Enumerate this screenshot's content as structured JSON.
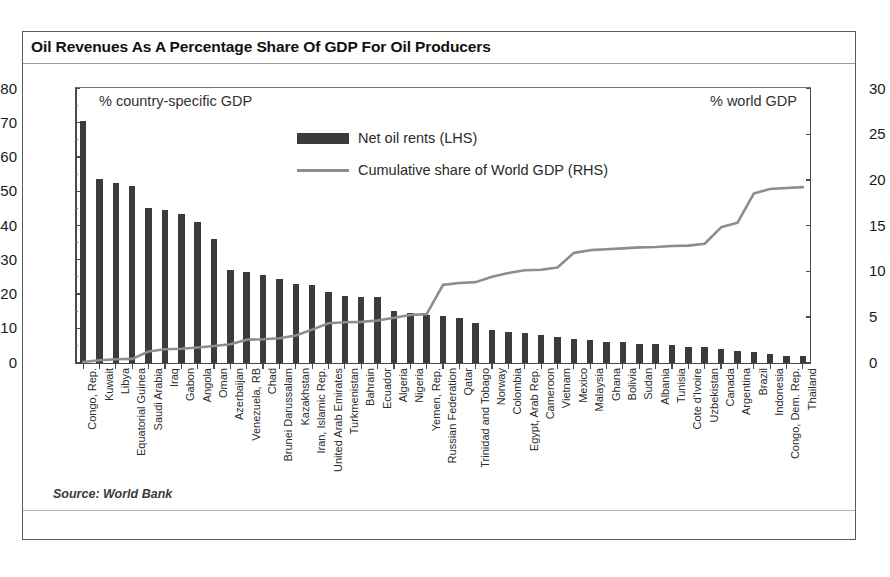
{
  "figure": {
    "title": "Oil Revenues As A Percentage Share Of GDP For Oil Producers",
    "source": "Source: World Bank",
    "left_annotation": "% country-specific GDP",
    "right_annotation": "% world GDP",
    "bar_color": "#3b3b3b",
    "line_color": "#8d8d8d",
    "frame_color": "#5a5a5a"
  },
  "legend": {
    "items": [
      {
        "label": "Net oil rents (LHS)",
        "marker": "bar-swatch"
      },
      {
        "label": "Cumulative share of World GDP (RHS)",
        "marker": "line-swatch"
      }
    ]
  },
  "axes": {
    "left_ticks": [
      "80",
      "70",
      "60",
      "50",
      "40",
      "30",
      "20",
      "10",
      "0"
    ],
    "right_ticks": [
      "30",
      "25",
      "20",
      "15",
      "10",
      "5",
      "0"
    ],
    "left_range": [
      0,
      80
    ],
    "right_range": [
      0,
      30
    ]
  },
  "chart_data": {
    "type": "bar",
    "title": "Oil Revenues As A Percentage Share Of GDP For Oil Producers",
    "subtitle": "",
    "xlabel": "",
    "ylabel": "% country-specific GDP",
    "y2label": "% world GDP",
    "ylim": [
      0,
      80
    ],
    "y2lim": [
      0,
      30
    ],
    "grid": false,
    "legend_position": "top-center",
    "source": "Source: World Bank",
    "categories": [
      "Congo, Rep.",
      "Kuwait",
      "Libya",
      "Equatorial Guinea",
      "Saudi Arabia",
      "Iraq",
      "Gabon",
      "Angola",
      "Oman",
      "Azerbaijan",
      "Venezuela, RB",
      "Chad",
      "Brunei Darussalam",
      "Kazakhstan",
      "Iran, Islamic Rep.",
      "United Arab Emirates",
      "Turkmenistan",
      "Bahrain",
      "Ecuador",
      "Algeria",
      "Nigeria",
      "Yemen, Rep.",
      "Russian Federation",
      "Qatar",
      "Trinidad and Tobago",
      "Norway",
      "Colombia",
      "Egypt, Arab Rep.",
      "Cameroon",
      "Vietnam",
      "Mexico",
      "Malaysia",
      "Ghana",
      "Bolivia",
      "Sudan",
      "Albania",
      "Tunisia",
      "Cote d'Ivoire",
      "Uzbekistan",
      "Canada",
      "Argentina",
      "Brazil",
      "Indonesia",
      "Congo, Dem. Rep.",
      "Thailand"
    ],
    "series": [
      {
        "name": "Net oil rents (LHS)",
        "type": "bar",
        "axis": "left",
        "unit": "% of country GDP",
        "values": [
          70.5,
          53.5,
          52.5,
          51.5,
          45.0,
          44.5,
          43.5,
          41.0,
          36.0,
          27.0,
          26.5,
          25.5,
          24.5,
          23.0,
          22.5,
          20.5,
          19.5,
          19.0,
          19.0,
          15.0,
          14.5,
          14.0,
          13.5,
          13.0,
          11.5,
          9.5,
          9.0,
          8.5,
          8.0,
          7.5,
          7.0,
          6.5,
          6.0,
          6.0,
          5.5,
          5.5,
          5.0,
          4.5,
          4.5,
          4.0,
          3.5,
          3.0,
          2.5,
          2.0,
          1.8
        ]
      },
      {
        "name": "Cumulative share of World GDP (RHS)",
        "type": "line",
        "axis": "right",
        "unit": "% of world GDP",
        "values": [
          0.05,
          0.25,
          0.35,
          0.4,
          1.2,
          1.45,
          1.5,
          1.65,
          1.8,
          2.0,
          2.5,
          2.55,
          2.65,
          2.95,
          3.6,
          4.3,
          4.4,
          4.45,
          4.6,
          4.9,
          5.2,
          5.3,
          8.5,
          8.7,
          8.8,
          9.4,
          9.8,
          10.1,
          10.15,
          10.4,
          12.0,
          12.3,
          12.4,
          12.5,
          12.6,
          12.65,
          12.75,
          12.8,
          13.0,
          14.8,
          15.3,
          18.5,
          19.0,
          19.1,
          19.2
        ]
      }
    ]
  }
}
